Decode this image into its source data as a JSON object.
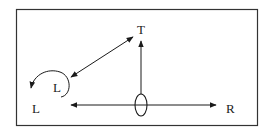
{
  "diagram": {
    "frame": {
      "x": 16,
      "y": 9,
      "width": 241,
      "height": 116,
      "stroke": "#333333"
    },
    "labels": {
      "top": "T",
      "right": "R",
      "left_outer": "L",
      "left_inner": "L"
    },
    "positions": {
      "top": {
        "x": 141,
        "y": 34
      },
      "right": {
        "x": 231,
        "y": 110
      },
      "left_outer": {
        "x": 37,
        "y": 112
      },
      "left_inner": {
        "x": 58,
        "y": 91
      }
    },
    "arrows": [
      {
        "name": "diagonal-double-arrow",
        "from": "L",
        "to": "T",
        "x1": 71,
        "y1": 77,
        "x2": 133,
        "y2": 37,
        "double": true
      },
      {
        "name": "vertical-arrow",
        "from": "origin",
        "to": "T",
        "x1": 141,
        "y1": 94,
        "x2": 141,
        "y2": 41,
        "double": false
      },
      {
        "name": "horizontal-arrow-right",
        "from": "origin",
        "to": "R",
        "x1": 141,
        "y1": 105,
        "x2": 216,
        "y2": 105,
        "double": false
      },
      {
        "name": "horizontal-arrow-left",
        "from": "origin",
        "to": "L",
        "x1": 141,
        "y1": 105,
        "x2": 71,
        "y2": 105,
        "double": false
      }
    ],
    "origin_ellipse": {
      "cx": 141,
      "cy": 105,
      "rx": 6,
      "ry": 11
    },
    "curved_arrow": {
      "description": "counterclockwise loop from inner L to outer L"
    },
    "stroke_color": "#1a1a1a"
  }
}
